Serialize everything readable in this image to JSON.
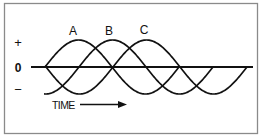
{
  "figure": {
    "border_color": "#8a8a8a",
    "ink_color": "#111111",
    "background": "#ffffff"
  },
  "axis": {
    "plus_label": "+",
    "zero_label": "0",
    "minus_label": "−",
    "x_start": 31,
    "x_end": 253,
    "y": 67
  },
  "time": {
    "label": "TIME",
    "arrow": "right-arrow"
  },
  "waves": {
    "amplitude": 27,
    "period": 134,
    "items": [
      {
        "label": "A",
        "zero_up_x": 45,
        "start_x": 45,
        "end_x": 179,
        "label_x": 73,
        "label_y": 35
      },
      {
        "label": "B",
        "zero_up_x": 79,
        "start_x": 44,
        "end_x": 213,
        "label_x": 109,
        "label_y": 35
      },
      {
        "label": "C",
        "zero_up_x": 113,
        "start_x": 45,
        "end_x": 247,
        "label_x": 144,
        "label_y": 34
      }
    ]
  }
}
